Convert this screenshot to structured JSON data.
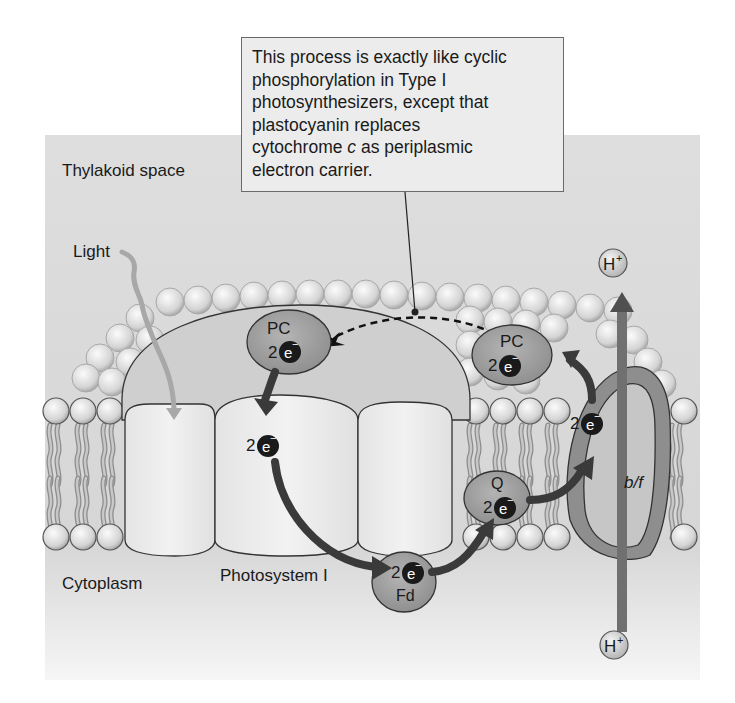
{
  "callout": {
    "lines": [
      "This process is exactly like cyclic",
      "phosphorylation in Type I",
      "photosynthesizers, except that",
      "plastocyanin replaces"
    ],
    "line5_pre": "cytochrome ",
    "line5_italic": "c",
    "line5_post": " as periplasmic",
    "line6": "electron carrier."
  },
  "regions": {
    "top": "Thylakoid space",
    "bottom": "Cytoplasm"
  },
  "labels": {
    "light": "Light",
    "photosystem": "Photosystem I",
    "pc_left": "PC",
    "pc_right": "PC",
    "q": "Q",
    "fd": "Fd",
    "bf": "b/f",
    "proton_top": "H",
    "proton_bottom": "H",
    "proton_charge": "+",
    "electron_count": "2",
    "electron_symbol": "e",
    "electron_charge": "−"
  },
  "colors": {
    "background": "#d9d9d9",
    "membrane_head": "#e8e8e8",
    "protein_light": "#eeeeee",
    "carrier": "#9a9a9a",
    "arrow_dark": "#3a3a3a",
    "bf_channel": "#7a7a7a"
  }
}
